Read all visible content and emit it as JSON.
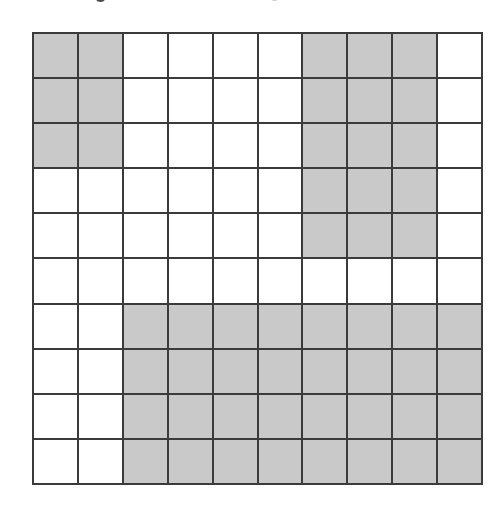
{
  "figure": {
    "type": "shaded-grid-diagram",
    "title": "",
    "rows": 10,
    "columns": 10,
    "cell_count": 100,
    "shaded_count": 49,
    "unshaded_count": 51,
    "colors": {
      "shaded_fill": "#c9c9c9",
      "unshaded_fill": "#ffffff",
      "grid_line": "#3b3b3b",
      "background": "#ffffff"
    },
    "legend": {
      "shaded_label": "",
      "unshaded_label": ""
    },
    "grid": [
      [
        1,
        1,
        0,
        0,
        0,
        0,
        1,
        1,
        1,
        0
      ],
      [
        1,
        1,
        0,
        0,
        0,
        0,
        1,
        1,
        1,
        0
      ],
      [
        1,
        1,
        0,
        0,
        0,
        0,
        1,
        1,
        1,
        0
      ],
      [
        0,
        0,
        0,
        0,
        0,
        0,
        1,
        1,
        1,
        0
      ],
      [
        0,
        0,
        0,
        0,
        0,
        0,
        1,
        1,
        1,
        0
      ],
      [
        0,
        0,
        0,
        0,
        0,
        0,
        0,
        0,
        0,
        0
      ],
      [
        0,
        0,
        1,
        1,
        1,
        1,
        1,
        1,
        1,
        1
      ],
      [
        0,
        0,
        1,
        1,
        1,
        1,
        1,
        1,
        1,
        1
      ],
      [
        0,
        0,
        1,
        1,
        1,
        1,
        1,
        1,
        1,
        1
      ],
      [
        0,
        0,
        1,
        1,
        1,
        1,
        1,
        1,
        1,
        1
      ]
    ],
    "row_shaded_counts": [
      5,
      5,
      5,
      3,
      3,
      0,
      8,
      8,
      8,
      8
    ],
    "column_shaded_counts": [
      3,
      3,
      4,
      4,
      4,
      4,
      9,
      9,
      9,
      4
    ],
    "regions": [
      {
        "name": "top-left-block",
        "rows": "1-3",
        "columns": "1-2",
        "cells": 6,
        "state": "shaded"
      },
      {
        "name": "top-right-block",
        "rows": "1-5",
        "columns": "7-9",
        "cells": 15,
        "state": "shaded"
      },
      {
        "name": "middle-blank-row",
        "rows": "6",
        "columns": "1-10",
        "cells": 10,
        "state": "unshaded"
      },
      {
        "name": "bottom-block",
        "rows": "7-10",
        "columns": "3-10",
        "cells": 32,
        "state": "shaded"
      }
    ],
    "artifacts": [
      {
        "name": "scan-speck-1"
      },
      {
        "name": "scan-speck-2"
      },
      {
        "name": "scan-speck-3"
      },
      {
        "name": "scan-speck-4"
      }
    ]
  },
  "chart_data": {
    "type": "heatmap",
    "title": "",
    "subtitle": "",
    "xlabel": "",
    "ylabel": "",
    "grid": true,
    "legend_position": "none",
    "categories_x": [
      "1",
      "2",
      "3",
      "4",
      "5",
      "6",
      "7",
      "8",
      "9",
      "10"
    ],
    "categories_y": [
      "1",
      "2",
      "3",
      "4",
      "5",
      "6",
      "7",
      "8",
      "9",
      "10"
    ],
    "values": [
      [
        1,
        1,
        0,
        0,
        0,
        0,
        1,
        1,
        1,
        0
      ],
      [
        1,
        1,
        0,
        0,
        0,
        0,
        1,
        1,
        1,
        0
      ],
      [
        1,
        1,
        0,
        0,
        0,
        0,
        1,
        1,
        1,
        0
      ],
      [
        0,
        0,
        0,
        0,
        0,
        0,
        1,
        1,
        1,
        0
      ],
      [
        0,
        0,
        0,
        0,
        0,
        0,
        1,
        1,
        1,
        0
      ],
      [
        0,
        0,
        0,
        0,
        0,
        0,
        0,
        0,
        0,
        0
      ],
      [
        0,
        0,
        1,
        1,
        1,
        1,
        1,
        1,
        1,
        1
      ],
      [
        0,
        0,
        1,
        1,
        1,
        1,
        1,
        1,
        1,
        1
      ],
      [
        0,
        0,
        1,
        1,
        1,
        1,
        1,
        1,
        1,
        1
      ],
      [
        0,
        0,
        1,
        1,
        1,
        1,
        1,
        1,
        1,
        1
      ]
    ],
    "value_labels": {
      "0": "unshaded",
      "1": "shaded"
    },
    "colorscale": [
      "#ffffff",
      "#c9c9c9"
    ],
    "zlim": [
      0,
      1
    ],
    "total_cells": 100,
    "shaded_cells": 49,
    "shaded_fraction": 0.49
  }
}
